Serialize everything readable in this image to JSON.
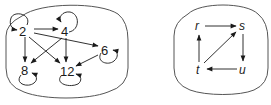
{
  "diagrams": [
    {
      "name": "divisibility-graph",
      "nodes": [
        {
          "id": "2",
          "label": "2"
        },
        {
          "id": "4",
          "label": "4"
        },
        {
          "id": "6",
          "label": "6"
        },
        {
          "id": "8",
          "label": "8"
        },
        {
          "id": "12",
          "label": "12"
        }
      ],
      "edges": [
        {
          "from": "2",
          "to": "2"
        },
        {
          "from": "4",
          "to": "4"
        },
        {
          "from": "6",
          "to": "6"
        },
        {
          "from": "8",
          "to": "8"
        },
        {
          "from": "12",
          "to": "12"
        },
        {
          "from": "2",
          "to": "4"
        },
        {
          "from": "2",
          "to": "6"
        },
        {
          "from": "2",
          "to": "8"
        },
        {
          "from": "2",
          "to": "12"
        },
        {
          "from": "4",
          "to": "8"
        },
        {
          "from": "4",
          "to": "12"
        },
        {
          "from": "6",
          "to": "12"
        }
      ]
    },
    {
      "name": "variable-graph",
      "nodes": [
        {
          "id": "r",
          "label": "r"
        },
        {
          "id": "s",
          "label": "s"
        },
        {
          "id": "t",
          "label": "t"
        },
        {
          "id": "u",
          "label": "u"
        }
      ],
      "edges": [
        {
          "from": "r",
          "to": "s"
        },
        {
          "from": "s",
          "to": "u"
        },
        {
          "from": "u",
          "to": "t"
        },
        {
          "from": "t",
          "to": "r"
        },
        {
          "from": "t",
          "to": "s"
        }
      ]
    }
  ],
  "colors": {
    "stroke": "#1a1a1a",
    "container": "#555555",
    "background": "#ffffff"
  }
}
